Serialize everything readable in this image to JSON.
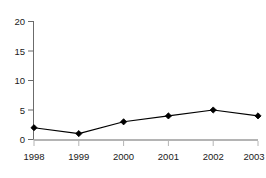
{
  "chart_data": {
    "type": "line",
    "title": "",
    "subtitle": "",
    "xlabel": "",
    "ylabel": "",
    "categories": [
      "1998",
      "1999",
      "2000",
      "2001",
      "2002",
      "2003"
    ],
    "x": [
      1998,
      1999,
      2000,
      2001,
      2002,
      2003
    ],
    "values": [
      2,
      1,
      3,
      4,
      5,
      4
    ],
    "series": [
      {
        "name": "",
        "values": [
          2,
          1,
          3,
          4,
          5,
          4
        ],
        "line_color": "#000000",
        "marker": "diamond",
        "marker_color": "#000000"
      }
    ],
    "ylim": [
      0,
      20
    ],
    "yticks": [
      0,
      5,
      10,
      15,
      20
    ],
    "ytick_labels": [
      "0",
      "5",
      "10",
      "15",
      "20"
    ],
    "xticks": [
      1998,
      1999,
      2000,
      2001,
      2002,
      2003
    ],
    "xtick_labels": [
      "1998",
      "1999",
      "2000",
      "2001",
      "2002",
      "2003"
    ],
    "grid": false,
    "legend": false,
    "legend_position": "none",
    "annotations": [],
    "colors": {
      "background": "#ffffff",
      "line": "#000000",
      "marker": "#000000",
      "y_axis": "#6b6b6b",
      "x_axis": "#b4b4b4",
      "tick_text": "#1a1a1a"
    }
  }
}
